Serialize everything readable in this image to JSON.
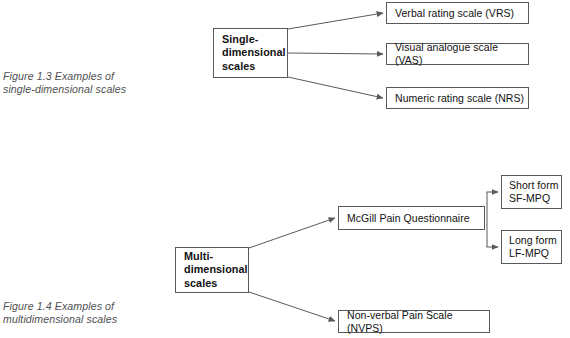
{
  "page": {
    "background_color": "#ffffff",
    "line_color": "#58595b",
    "text_color": "#111111",
    "caption_color": "#4f5052"
  },
  "figures": [
    {
      "id": "figure-1-3",
      "caption": "Figure 1.3  Examples of\nsingle-dimensional scales",
      "root": {
        "label": "Single-\ndimensional\nscales"
      },
      "children": [
        {
          "label": "Verbal rating scale (VRS)"
        },
        {
          "label": "Visual analogue scale (VAS)"
        },
        {
          "label": "Numeric rating scale (NRS)"
        }
      ]
    },
    {
      "id": "figure-1-4",
      "caption": "Figure 1.4  Examples of\nmultidimensional scales",
      "root": {
        "label": "Multi-\ndimensional\nscales"
      },
      "children": [
        {
          "label": "McGill Pain Questionnaire"
        },
        {
          "label": "Non-verbal Pain Scale (NVPS)"
        }
      ],
      "grandchildren": [
        {
          "label": "Short form\nSF-MPQ"
        },
        {
          "label": "Long form\nLF-MPQ"
        }
      ]
    }
  ]
}
